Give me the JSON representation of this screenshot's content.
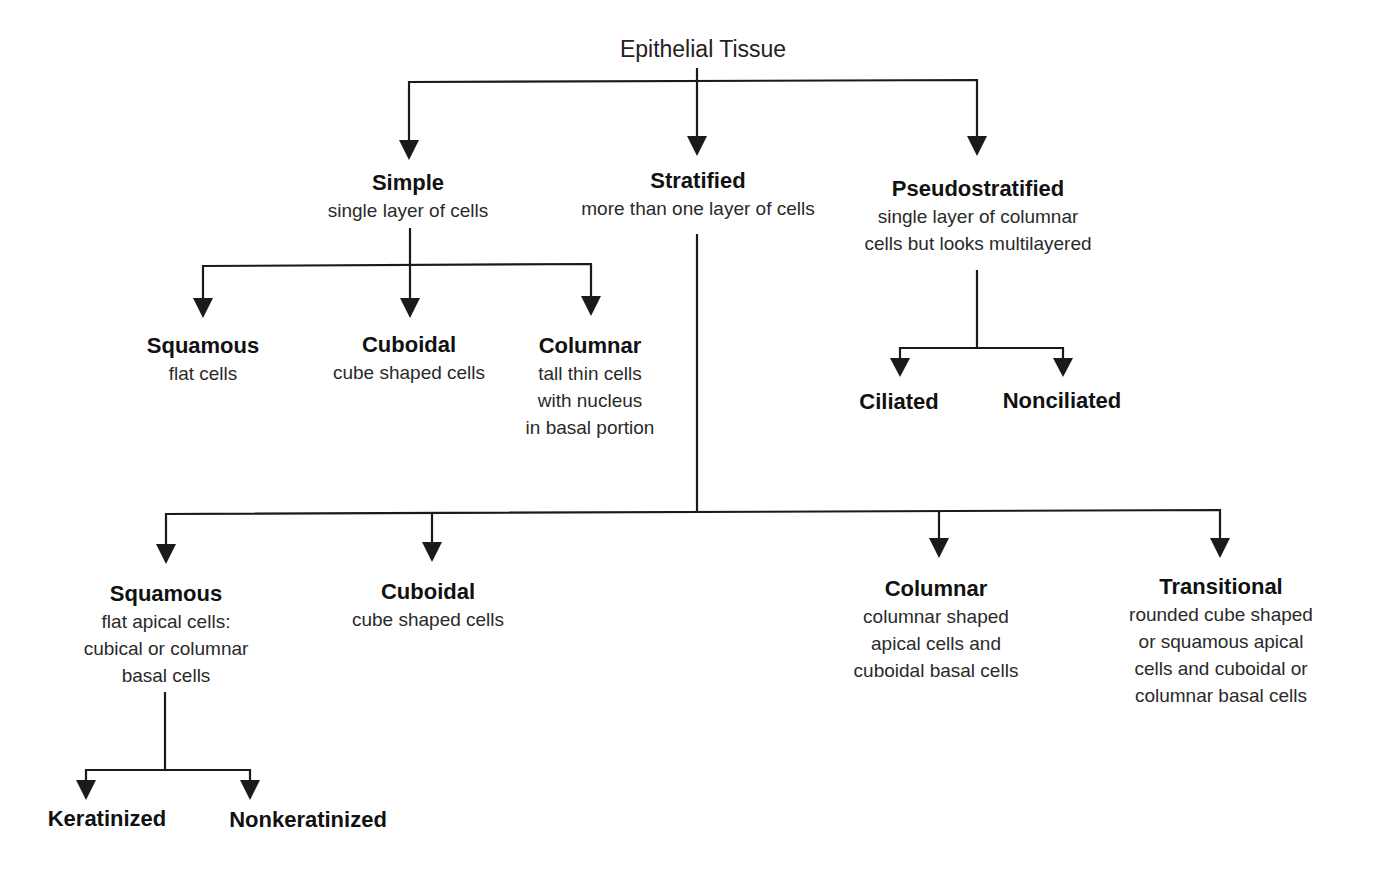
{
  "diagram": {
    "root": "Epithelial Tissue",
    "level1": {
      "simple": {
        "title": "Simple",
        "desc": [
          "single layer of cells"
        ]
      },
      "stratified": {
        "title": "Stratified",
        "desc": [
          "more than one layer of cells"
        ]
      },
      "pseudostratified": {
        "title": "Pseudostratified",
        "desc": [
          "single layer of columnar",
          "cells but looks multilayered"
        ]
      }
    },
    "simple_children": [
      {
        "title": "Squamous",
        "desc": [
          "flat cells"
        ]
      },
      {
        "title": "Cuboidal",
        "desc": [
          "cube shaped cells"
        ]
      },
      {
        "title": "Columnar",
        "desc": [
          "tall thin cells",
          "with nucleus",
          "in basal portion"
        ]
      }
    ],
    "pseudostratified_children": [
      {
        "title": "Ciliated"
      },
      {
        "title": "Nonciliated"
      }
    ],
    "stratified_children": [
      {
        "title": "Squamous",
        "desc": [
          "flat apical cells:",
          "cubical or columnar",
          "basal cells"
        ]
      },
      {
        "title": "Cuboidal",
        "desc": [
          "cube shaped cells"
        ]
      },
      {
        "title": "Columnar",
        "desc": [
          "columnar shaped",
          "apical cells and",
          "cuboidal basal cells"
        ]
      },
      {
        "title": "Transitional",
        "desc": [
          "rounded cube shaped",
          "or squamous apical",
          "cells and cuboidal or",
          "columnar basal cells"
        ]
      }
    ],
    "stratified_squamous_children": [
      {
        "title": "Keratinized"
      },
      {
        "title": "Nonkeratinized"
      }
    ],
    "colors": {
      "line": "#1a1a1a",
      "text": "#1a1a1a",
      "background": "#ffffff"
    }
  }
}
